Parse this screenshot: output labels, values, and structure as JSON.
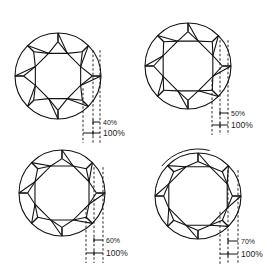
{
  "diagram": {
    "title": "",
    "stroke_color": "#111111",
    "panels": [
      {
        "id": "panel-40",
        "table_label": "40%",
        "total_label": "100%",
        "table_ratio": 0.4,
        "rotation_arc": false
      },
      {
        "id": "panel-50",
        "table_label": "50%",
        "total_label": "100%",
        "table_ratio": 0.5,
        "rotation_arc": false
      },
      {
        "id": "panel-60",
        "table_label": "60%",
        "total_label": "100%",
        "table_ratio": 0.6,
        "rotation_arc": false
      },
      {
        "id": "panel-70",
        "table_label": "70%",
        "total_label": "100%",
        "table_ratio": 0.7,
        "rotation_arc": true
      }
    ]
  }
}
